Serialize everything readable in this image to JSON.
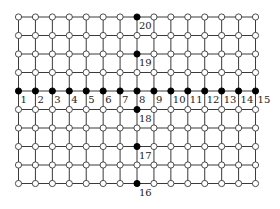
{
  "diagram": {
    "type": "grid-graph",
    "columns": 15,
    "rows": 10,
    "origin_x": 18.5,
    "origin_y": 17,
    "col_spacing": 16.93,
    "row_spacing": 18.5,
    "node_radius": 3.1,
    "colors": {
      "edge": "#3a3a3a",
      "open_node_fill": "#ffffff",
      "filled_node_fill": "#000000",
      "label": "#222222"
    },
    "labeled_nodes": [
      {
        "label": "1",
        "col": 1,
        "row": 5
      },
      {
        "label": "2",
        "col": 2,
        "row": 5
      },
      {
        "label": "3",
        "col": 3,
        "row": 5
      },
      {
        "label": "4",
        "col": 4,
        "row": 5
      },
      {
        "label": "5",
        "col": 5,
        "row": 5
      },
      {
        "label": "6",
        "col": 6,
        "row": 5
      },
      {
        "label": "7",
        "col": 7,
        "row": 5
      },
      {
        "label": "8",
        "col": 8,
        "row": 5
      },
      {
        "label": "9",
        "col": 9,
        "row": 5
      },
      {
        "label": "10",
        "col": 10,
        "row": 5
      },
      {
        "label": "11",
        "col": 11,
        "row": 5
      },
      {
        "label": "12",
        "col": 12,
        "row": 5
      },
      {
        "label": "13",
        "col": 13,
        "row": 5
      },
      {
        "label": "14",
        "col": 14,
        "row": 5
      },
      {
        "label": "15",
        "col": 15,
        "row": 5
      },
      {
        "label": "16",
        "col": 8,
        "row": 10
      },
      {
        "label": "17",
        "col": 8,
        "row": 8
      },
      {
        "label": "18",
        "col": 8,
        "row": 6
      },
      {
        "label": "19",
        "col": 8,
        "row": 3
      },
      {
        "label": "20",
        "col": 8,
        "row": 1
      }
    ]
  }
}
